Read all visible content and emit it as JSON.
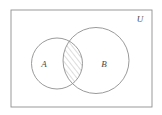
{
  "figure": {
    "type": "venn-diagram",
    "background_color": "#ffffff",
    "stroke_color": "#8f8f8f",
    "label_color": "#4a4a4a",
    "hatch_color": "#9a9a9a"
  },
  "universe": {
    "label": "U",
    "shape": "rectangle",
    "x": 11,
    "y": 10,
    "width": 141,
    "height": 97,
    "label_x": 140,
    "label_y": 22
  },
  "sets": [
    {
      "label": "A",
      "shape": "circle",
      "cx": 57,
      "cy": 63.5,
      "r": 25.5,
      "label_x": 44,
      "label_y": 67
    },
    {
      "label": "B",
      "shape": "circle",
      "cx": 96,
      "cy": 60.5,
      "r": 33,
      "label_x": 104,
      "label_y": 67
    }
  ],
  "intersection": {
    "name": "A-intersect-B",
    "shaded": true,
    "hatch_pattern": "diagonal-lines",
    "hatch_angle_degrees": 38,
    "hatch_spacing_px": 4
  }
}
